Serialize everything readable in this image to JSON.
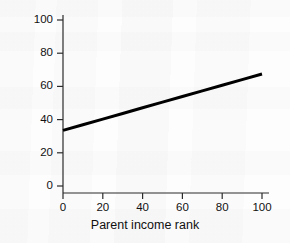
{
  "chart_data": {
    "type": "line",
    "title": "",
    "xlabel": "Parent income rank",
    "ylabel": "Average child income rank",
    "xlim": [
      0,
      100
    ],
    "ylim": [
      0,
      100
    ],
    "xticks": [
      0,
      20,
      40,
      60,
      80,
      100
    ],
    "yticks": [
      0,
      20,
      40,
      60,
      80,
      100
    ],
    "xtick_labels": [
      "0",
      "20",
      "40",
      "60",
      "80",
      "100"
    ],
    "ytick_labels": [
      "0",
      "20",
      "40",
      "60",
      "80",
      "100"
    ],
    "grid": false,
    "legend": false,
    "series": [
      {
        "name": "Average child income rank",
        "color": "#000000",
        "linewidth": 3,
        "x": [
          0,
          10,
          20,
          30,
          40,
          50,
          60,
          70,
          80,
          90,
          100
        ],
        "values": [
          33.5,
          36.9,
          40.3,
          43.7,
          47.1,
          50.5,
          53.9,
          57.3,
          60.7,
          64.1,
          67.5
        ]
      }
    ],
    "annotations": []
  },
  "axes": {
    "x_axis_name": "x-axis",
    "y_axis_name": "y-axis",
    "tick_direction": "out",
    "axis_color": "#2b2b2b"
  }
}
